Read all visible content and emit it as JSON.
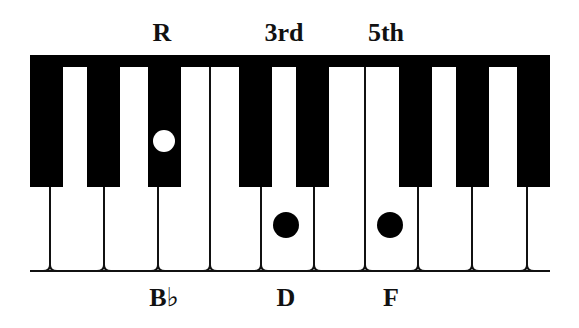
{
  "diagram": {
    "colors": {
      "background": "#ffffff",
      "key_black": "#000000",
      "key_white": "#ffffff",
      "line": "#111111",
      "root_marker": "#ffffff",
      "chord_marker": "#000000"
    },
    "keyboard": {
      "left": 30,
      "right": 550,
      "top": 55,
      "top_border_bottom": 67,
      "black_key_bottom": 187,
      "bottom_line_y": 271,
      "black_keys": [
        {
          "x": 30,
          "w": 33
        },
        {
          "x": 87,
          "w": 33
        },
        {
          "x": 148,
          "w": 33
        },
        {
          "x": 239,
          "w": 33
        },
        {
          "x": 296,
          "w": 33
        },
        {
          "x": 399,
          "w": 33
        },
        {
          "x": 456,
          "w": 33
        },
        {
          "x": 517,
          "w": 33
        }
      ],
      "white_key_dividers": [
        50,
        104,
        158,
        210,
        261,
        314,
        365,
        418,
        472,
        527
      ],
      "free_dividers": [
        210,
        365
      ]
    },
    "markers": [
      {
        "name": "root-marker",
        "cx": 164,
        "cy": 141,
        "r": 11,
        "fill": "#ffffff",
        "note": "Bb"
      },
      {
        "name": "third-marker",
        "cx": 286,
        "cy": 225,
        "r": 13,
        "fill": "#000000",
        "note": "D"
      },
      {
        "name": "fifth-marker",
        "cx": 390,
        "cy": 225,
        "r": 13,
        "fill": "#000000",
        "note": "F"
      }
    ],
    "top_labels": [
      {
        "text": "R",
        "x": 162
      },
      {
        "text": "3rd",
        "x": 284
      },
      {
        "text": "5th",
        "x": 386
      }
    ],
    "bottom_labels": [
      {
        "text": "B♭",
        "x": 164
      },
      {
        "text": "D",
        "x": 286
      },
      {
        "text": "F",
        "x": 391
      }
    ]
  }
}
